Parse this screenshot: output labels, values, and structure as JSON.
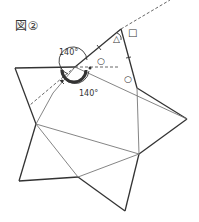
{
  "figure": {
    "title": "図②",
    "angle_labels": [
      {
        "text": "140°",
        "x": 59,
        "y": 55
      },
      {
        "text": "140°",
        "x": 79,
        "y": 96
      }
    ],
    "markers": {
      "triangle": "△",
      "square": "□",
      "circle_top": "○",
      "circle_bottom": "○"
    },
    "colors": {
      "line": "#333333",
      "thin_line": "#666666",
      "dashed": "#555555"
    }
  }
}
